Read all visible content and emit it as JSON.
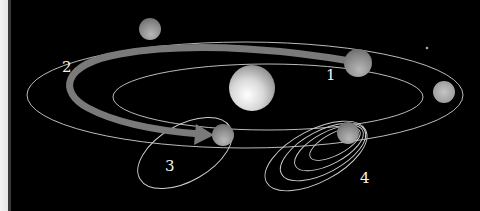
{
  "diagram": {
    "title": "",
    "background": "#000000",
    "labels": [
      {
        "id": "1",
        "text": "1",
        "x": 326,
        "y": 80
      },
      {
        "id": "2",
        "text": "2",
        "x": 62,
        "y": 72
      },
      {
        "id": "3",
        "text": "3",
        "x": 165,
        "y": 171
      },
      {
        "id": "4",
        "text": "4",
        "x": 360,
        "y": 183
      }
    ],
    "bodies": [
      {
        "name": "sun",
        "cx": 252,
        "cy": 88,
        "r": 23
      },
      {
        "name": "planet-top",
        "cx": 150,
        "cy": 29,
        "r": 11
      },
      {
        "name": "planet-1",
        "cx": 358,
        "cy": 63,
        "r": 14
      },
      {
        "name": "planet-right",
        "cx": 444,
        "cy": 92,
        "r": 11
      },
      {
        "name": "planet-3",
        "cx": 223,
        "cy": 135,
        "r": 11
      },
      {
        "name": "planet-4",
        "cx": 348,
        "cy": 133,
        "r": 11
      }
    ],
    "colors": {
      "orbit": "#d8d8d8",
      "arrow": "#7a7a7a",
      "label": "#f2f2f2"
    }
  }
}
